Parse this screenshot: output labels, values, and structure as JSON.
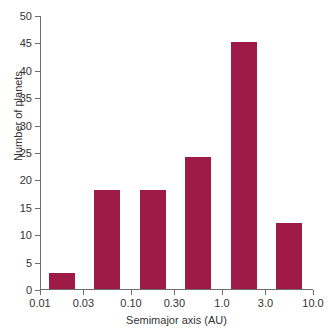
{
  "chart_data": {
    "type": "bar",
    "title": "",
    "subtitle": "",
    "xlabel": "Semimajor axis (AU)",
    "ylabel": "Number of planets",
    "xscale": "log",
    "yscale": "linear",
    "ylim": [
      0,
      50
    ],
    "xlim": [
      0.01,
      10.0
    ],
    "grid": false,
    "legend": false,
    "legend_position": "none",
    "bar_color": "#9E1B47",
    "axis_color": "#6e6e6e",
    "background_color": "#ffffff",
    "categories": [
      "0.01-0.03",
      "0.03-0.10",
      "0.10-0.30",
      "0.30-1.0",
      "1.0-3.0",
      "3.0-10.0"
    ],
    "values": [
      3,
      18,
      18,
      24,
      45,
      12
    ],
    "bars": [
      {
        "label": "0.01-0.03",
        "value": 3,
        "x_center": 0.0173
      },
      {
        "label": "0.03-0.10",
        "value": 18,
        "x_center": 0.0548
      },
      {
        "label": "0.10-0.30",
        "value": 18,
        "x_center": 0.173
      },
      {
        "label": "0.30-1.0",
        "value": 24,
        "x_center": 0.548
      },
      {
        "label": "1.0-3.0",
        "value": 45,
        "x_center": 1.73
      },
      {
        "label": "3.0-10.0",
        "value": 12,
        "x_center": 5.48
      }
    ],
    "x_ticks": [
      {
        "value": 0.01,
        "label": "0.01"
      },
      {
        "value": 0.03,
        "label": "0.03"
      },
      {
        "value": 0.1,
        "label": "0.10"
      },
      {
        "value": 0.3,
        "label": "0.30"
      },
      {
        "value": 1.0,
        "label": "1.0"
      },
      {
        "value": 3.0,
        "label": "3.0"
      },
      {
        "value": 10.0,
        "label": "10.0"
      }
    ],
    "y_ticks": [
      {
        "value": 0,
        "label": "0"
      },
      {
        "value": 5,
        "label": "5"
      },
      {
        "value": 10,
        "label": "10"
      },
      {
        "value": 15,
        "label": "15"
      },
      {
        "value": 20,
        "label": "20"
      },
      {
        "value": 25,
        "label": "25"
      },
      {
        "value": 30,
        "label": "30"
      },
      {
        "value": 35,
        "label": "35"
      },
      {
        "value": 40,
        "label": "40"
      },
      {
        "value": 45,
        "label": "45"
      },
      {
        "value": 50,
        "label": "50"
      }
    ],
    "annotations": []
  }
}
